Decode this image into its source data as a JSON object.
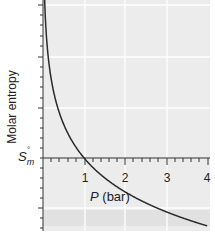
{
  "chart_data": {
    "type": "line",
    "title": "",
    "xlabel": "P (bar)",
    "xlabel_var": "P",
    "xlabel_unit": "(bar)",
    "ylabel": "Molar entropy",
    "origin_label": "S°m",
    "origin_label_parts": {
      "base": "S",
      "superscript": "°",
      "subscript": "m"
    },
    "x_ticks": [
      "1",
      "2",
      "3",
      "4"
    ],
    "x_tick_values": [
      1,
      2,
      3,
      4
    ],
    "xlim": [
      0,
      4
    ],
    "y_ticks_labeled": false,
    "grid": true,
    "series": [
      {
        "name": "Molar entropy",
        "color": "#2a2a2a",
        "x": [
          0.04,
          0.1,
          0.2,
          0.3,
          0.5,
          0.75,
          1.0,
          1.5,
          2.0,
          2.5,
          3.0,
          3.5,
          4.0
        ],
        "y_relative_to_S0m": [
          3.22,
          2.3,
          1.61,
          1.2,
          0.69,
          0.29,
          0.0,
          -0.41,
          -0.69,
          -0.92,
          -1.1,
          -1.25,
          -1.39
        ]
      }
    ],
    "legend": "none"
  },
  "colors": {
    "plot_background": "#ececec",
    "gridline": "#ffffff",
    "axis": "#333333",
    "curve": "#2a2a2a",
    "band": "#e0e0e0"
  }
}
